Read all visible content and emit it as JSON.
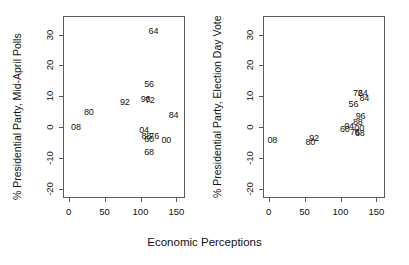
{
  "figure": {
    "shared_xlabel": "Economic Perceptions",
    "frame_color": "#5a5a5a",
    "label_color": "#111111",
    "background": "#ffffff"
  },
  "chart_data": [
    {
      "type": "scatter",
      "panel": "left",
      "title": "",
      "xlabel": "Economic Perceptions",
      "ylabel": "% Presidential Party, Mid-April Polls",
      "xlim": [
        -8,
        162
      ],
      "ylim": [
        -23,
        36
      ],
      "xticks": [
        0,
        50,
        100,
        150
      ],
      "yticks": [
        -20,
        -10,
        0,
        10,
        20,
        30
      ],
      "xtick_labels": [
        "0",
        "50",
        "100",
        "150"
      ],
      "ytick_labels": [
        "-20",
        "-10",
        "0",
        "10",
        "20",
        "30"
      ],
      "grid": false,
      "legend": "none",
      "marker_style": "text-label",
      "points": [
        {
          "label": "64",
          "x": 118,
          "y": 31
        },
        {
          "label": "56",
          "x": 112,
          "y": 14
        },
        {
          "label": "96",
          "x": 107,
          "y": 9
        },
        {
          "label": "72",
          "x": 113,
          "y": 8.7
        },
        {
          "label": "92",
          "x": 78,
          "y": 8
        },
        {
          "label": "80",
          "x": 28,
          "y": 5
        },
        {
          "label": "84",
          "x": 146,
          "y": 4
        },
        {
          "label": "08",
          "x": 10,
          "y": 0
        },
        {
          "label": "04",
          "x": 105,
          "y": -0.8
        },
        {
          "label": "88",
          "x": 108,
          "y": -3
        },
        {
          "label": "76",
          "x": 119,
          "y": -2.8
        },
        {
          "label": "60",
          "x": 112,
          "y": -4
        },
        {
          "label": "00",
          "x": 136,
          "y": -4.2
        },
        {
          "label": "68",
          "x": 112,
          "y": -8
        }
      ]
    },
    {
      "type": "scatter",
      "panel": "right",
      "title": "",
      "xlabel": "Economic Perceptions",
      "ylabel": "% Presidential Party, Election Day Vote",
      "xlim": [
        -8,
        162
      ],
      "ylim": [
        -23,
        36
      ],
      "xticks": [
        0,
        50,
        100,
        150
      ],
      "yticks": [
        -20,
        -10,
        0,
        10,
        20,
        30
      ],
      "xtick_labels": [
        "0",
        "50",
        "100",
        "150"
      ],
      "ytick_labels": [
        "-20",
        "-10",
        "0",
        "10",
        "20",
        "30"
      ],
      "grid": false,
      "legend": "none",
      "marker_style": "text-label",
      "points": [
        {
          "label": "72",
          "x": 124,
          "y": 11.2
        },
        {
          "label": "64",
          "x": 131,
          "y": 11.0
        },
        {
          "label": "84",
          "x": 133,
          "y": 9.4
        },
        {
          "label": "56",
          "x": 118,
          "y": 7.4
        },
        {
          "label": "96",
          "x": 128,
          "y": 3.6
        },
        {
          "label": "88",
          "x": 124,
          "y": 1.6
        },
        {
          "label": "04",
          "x": 112,
          "y": 0.5
        },
        {
          "label": "00",
          "x": 126,
          "y": -0.4
        },
        {
          "label": "60",
          "x": 106,
          "y": -0.6
        },
        {
          "label": "76",
          "x": 120,
          "y": -1.6
        },
        {
          "label": "68",
          "x": 127,
          "y": -1.9
        },
        {
          "label": "92",
          "x": 63,
          "y": -3.4
        },
        {
          "label": "80",
          "x": 58,
          "y": -5.0
        },
        {
          "label": "08",
          "x": 5,
          "y": -4.2
        }
      ]
    }
  ]
}
